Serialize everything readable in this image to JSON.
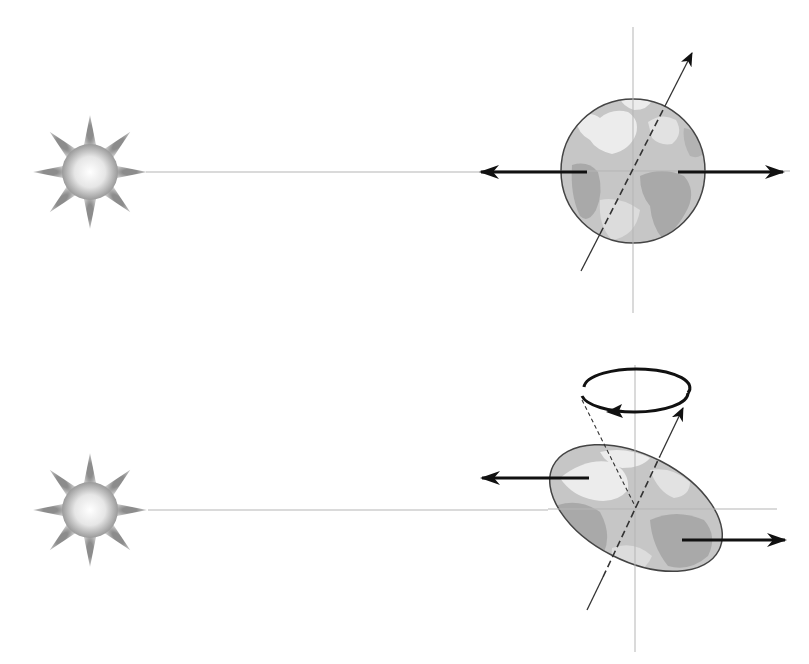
{
  "figure": {
    "caption_fragment_visible": true,
    "colors": {
      "background": "#ffffff",
      "reference_line": "#b5b5b5",
      "arrow": "#111111",
      "axis_line": "#333333",
      "globe_outline": "#444444",
      "ocean": "#c6c6c6",
      "land_light": "#ececec",
      "land_dark": "#a9a9a9",
      "sun_core_center": "#ffffff",
      "sun_core_edge": "#9a9a9a",
      "sun_ray": "#a4a4a4"
    }
  },
  "panels": [
    {
      "id": "top",
      "description": "Spherical Earth: equal and opposite forces, no net torque",
      "sun": {
        "cx": 90,
        "cy": 172,
        "r_core": 28,
        "r_ray": 57,
        "rays": 8
      },
      "sun_line": {
        "x1": 146,
        "y1": 172,
        "x2": 480,
        "y2": 172
      },
      "earth": {
        "shape": "circle",
        "cx": 633,
        "cy": 171,
        "rx": 72,
        "ry": 72,
        "rotation": 0
      },
      "horizontal_ref": {
        "x1": 480,
        "x2": 790,
        "y": 171
      },
      "vertical_ref": {
        "x": 633,
        "y1": 27,
        "y2": 313
      },
      "rotation_axis": {
        "x1": 581,
        "y1": 271,
        "x2": 692,
        "y2": 53,
        "dashed_inside": true
      },
      "force_left": {
        "x_from": 587,
        "x_to": 481,
        "y": 172,
        "label": "force-toward-left"
      },
      "force_right": {
        "x_from": 678,
        "x_to": 783,
        "y": 172,
        "label": "force-toward-right"
      }
    },
    {
      "id": "bottom",
      "description": "Oblate tilted Earth: forces produce torque, axis precesses around a cone",
      "sun": {
        "cx": 90,
        "cy": 510,
        "r_core": 28,
        "r_ray": 57,
        "rays": 8
      },
      "sun_line": {
        "x1": 148,
        "y1": 510,
        "x2": 548,
        "y2": 510
      },
      "earth": {
        "shape": "ellipse",
        "cx": 636,
        "cy": 508,
        "rx": 93,
        "ry": 53,
        "rotation": 27
      },
      "horizontal_ref": {
        "x1": 548,
        "x2": 777,
        "y": 509
      },
      "vertical_ref": {
        "x": 635,
        "y1": 365,
        "y2": 652
      },
      "rotation_axis": {
        "x1": 587,
        "y1": 610,
        "x2": 683,
        "y2": 408,
        "dashed_inside": true
      },
      "cone_dashed_line": {
        "x1": 582,
        "y1": 400,
        "x2": 636,
        "y2": 508
      },
      "precession_ring": {
        "cx": 635,
        "cy": 393,
        "rx": 53,
        "ry": 19,
        "direction": "counterclockwise-front-leftward"
      },
      "force_left": {
        "x_from": 589,
        "x_to": 482,
        "y": 478,
        "label": "force-toward-left"
      },
      "force_right": {
        "x_from": 682,
        "x_to": 785,
        "y": 540,
        "label": "force-toward-right"
      }
    }
  ]
}
